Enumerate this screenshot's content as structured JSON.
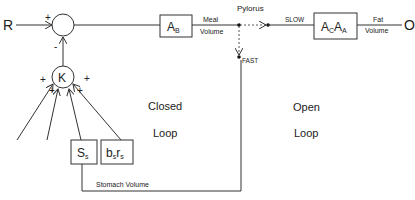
{
  "diagram": {
    "input_label": "R",
    "output_label": "O",
    "summing_junction": {
      "plus_sign": "+",
      "minus_sign": "-"
    },
    "controller": {
      "label": "K",
      "input_signs": [
        "+",
        "+",
        "+",
        "+"
      ]
    },
    "blocks": {
      "ab": {
        "main": "A",
        "sub": "B"
      },
      "acaa": {
        "main1": "A",
        "sub1": "C",
        "main2": "A",
        "sub2": "A"
      },
      "ss": {
        "main": "S",
        "sub": "s"
      },
      "bsrs": {
        "main1": "b",
        "sub1": "s",
        "main2": "r",
        "sub2": "s"
      }
    },
    "labels": {
      "meal": "Meal",
      "meal_volume": "Volume",
      "pylorus": "Pylorus",
      "slow": "SLOW",
      "fast": "FAST",
      "fat": "Fat",
      "fat_volume": "Volume",
      "stomach_volume": "Stomach Volume",
      "closed": "Closed",
      "closed_loop": "Loop",
      "open": "Open",
      "open_loop": "Loop"
    },
    "colors": {
      "line": "#333333",
      "text": "#222222",
      "background": "#ffffff"
    }
  }
}
